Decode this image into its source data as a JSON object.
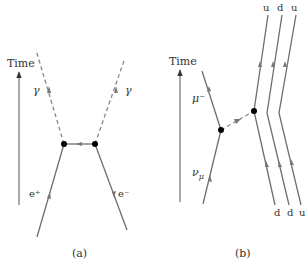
{
  "panel_a": {
    "caption": "(a)",
    "time_label": "Time",
    "photon_left_label": "γ",
    "photon_right_label": "γ",
    "positron_label": "e⁺",
    "electron_label": "e⁻"
  },
  "panel_b": {
    "caption": "(b)",
    "time_label": "Time",
    "muon_label": "μ⁻",
    "neutrino_label": "ν",
    "neutrino_sub": "μ",
    "top_quarks": [
      "u",
      "d",
      "u"
    ],
    "bottom_quarks": [
      "d",
      "d",
      "u"
    ]
  },
  "colors": {
    "line": "#6e6e6e",
    "vertex": "#000000",
    "text": "#333333"
  }
}
